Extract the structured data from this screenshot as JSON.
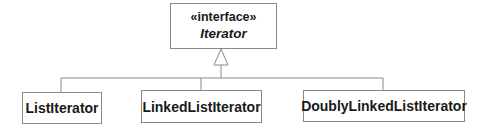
{
  "diagram": {
    "type": "UML class diagram (realization)",
    "interface": {
      "stereotype": "«interface»",
      "name": "Iterator"
    },
    "implementations": [
      {
        "name": "ListIterator"
      },
      {
        "name": "LinkedListIterator"
      },
      {
        "name": "DoublyLinkedListIterator"
      }
    ],
    "colors": {
      "line": "#8a8a8a",
      "text": "#1a1a1a",
      "background": "#ffffff"
    }
  }
}
